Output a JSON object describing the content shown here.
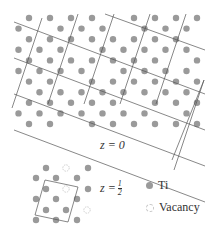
{
  "figure": {
    "top_label": "z = 0",
    "bottom_label_prefix": "z = ",
    "bottom_label_num": "1",
    "bottom_label_den": "2",
    "legend": [
      {
        "label": "Ti",
        "icon": "filled-circle-icon"
      },
      {
        "label": "Vacancy",
        "icon": "dashed-circle-icon"
      }
    ],
    "colors": {
      "atom": "#9a9a9a",
      "line": "#555555",
      "vacancy": "#c8c8c8"
    }
  }
}
